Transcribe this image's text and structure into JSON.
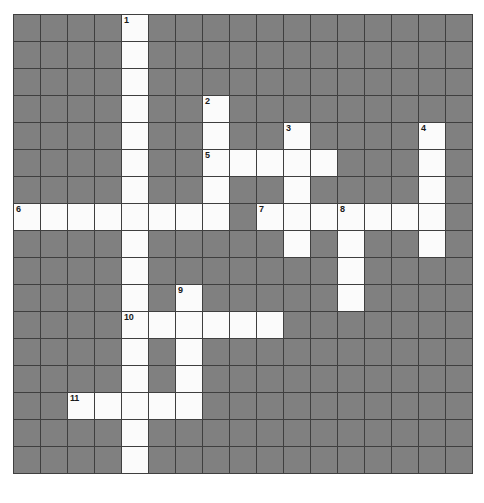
{
  "puzzle": {
    "type": "crossword-grid",
    "title": "Crossword Puzzle Grid",
    "rows": 17,
    "columns": 17,
    "cell_size_px": 26,
    "colors": {
      "block": "#808080",
      "open": "#fbfbfb",
      "gridline": "#3f3f3f",
      "number": "#1a1a1a",
      "page_background": "#ffffff"
    },
    "clue_numbers": [
      {
        "number": "1",
        "row": 0,
        "col": 4,
        "direction": "down"
      },
      {
        "number": "2",
        "row": 3,
        "col": 7,
        "direction": "down"
      },
      {
        "number": "3",
        "row": 4,
        "col": 10,
        "direction": "down"
      },
      {
        "number": "4",
        "row": 4,
        "col": 15,
        "direction": "down"
      },
      {
        "number": "5",
        "row": 5,
        "col": 7,
        "direction": "across"
      },
      {
        "number": "6",
        "row": 7,
        "col": 0,
        "direction": "across"
      },
      {
        "number": "7",
        "row": 7,
        "col": 9,
        "direction": "across"
      },
      {
        "number": "8",
        "row": 7,
        "col": 12,
        "direction": "across"
      },
      {
        "number": "9",
        "row": 10,
        "col": 6,
        "direction": "down"
      },
      {
        "number": "10",
        "row": 11,
        "col": 4,
        "direction": "across"
      },
      {
        "number": "11",
        "row": 14,
        "col": 2,
        "direction": "across"
      }
    ],
    "grid": [
      [
        0,
        0,
        0,
        0,
        1,
        0,
        0,
        0,
        0,
        0,
        0,
        0,
        0,
        0,
        0,
        0,
        0
      ],
      [
        0,
        0,
        0,
        0,
        1,
        0,
        0,
        0,
        0,
        0,
        0,
        0,
        0,
        0,
        0,
        0,
        0
      ],
      [
        0,
        0,
        0,
        0,
        1,
        0,
        0,
        0,
        0,
        0,
        0,
        0,
        0,
        0,
        0,
        0,
        0
      ],
      [
        0,
        0,
        0,
        0,
        1,
        0,
        0,
        1,
        0,
        0,
        0,
        0,
        0,
        0,
        0,
        0,
        0
      ],
      [
        0,
        0,
        0,
        0,
        1,
        0,
        0,
        1,
        0,
        0,
        1,
        0,
        0,
        0,
        0,
        1,
        0
      ],
      [
        0,
        0,
        0,
        0,
        1,
        0,
        0,
        1,
        1,
        1,
        1,
        1,
        0,
        0,
        0,
        1,
        0
      ],
      [
        0,
        0,
        0,
        0,
        1,
        0,
        0,
        1,
        0,
        0,
        1,
        0,
        0,
        0,
        0,
        1,
        0
      ],
      [
        1,
        1,
        1,
        1,
        1,
        1,
        1,
        1,
        0,
        1,
        1,
        1,
        1,
        1,
        1,
        1,
        0
      ],
      [
        0,
        0,
        0,
        0,
        1,
        0,
        0,
        0,
        0,
        0,
        1,
        0,
        1,
        0,
        0,
        1,
        0
      ],
      [
        0,
        0,
        0,
        0,
        1,
        0,
        0,
        0,
        0,
        0,
        0,
        0,
        1,
        0,
        0,
        0,
        0
      ],
      [
        0,
        0,
        0,
        0,
        1,
        0,
        1,
        0,
        0,
        0,
        0,
        0,
        1,
        0,
        0,
        0,
        0
      ],
      [
        0,
        0,
        0,
        0,
        1,
        1,
        1,
        1,
        1,
        1,
        0,
        0,
        0,
        0,
        0,
        0,
        0
      ],
      [
        0,
        0,
        0,
        0,
        1,
        0,
        1,
        0,
        0,
        0,
        0,
        0,
        0,
        0,
        0,
        0,
        0
      ],
      [
        0,
        0,
        0,
        0,
        1,
        0,
        1,
        0,
        0,
        0,
        0,
        0,
        0,
        0,
        0,
        0,
        0
      ],
      [
        0,
        0,
        1,
        1,
        1,
        1,
        1,
        0,
        0,
        0,
        0,
        0,
        0,
        0,
        0,
        0,
        0
      ],
      [
        0,
        0,
        0,
        0,
        1,
        0,
        0,
        0,
        0,
        0,
        0,
        0,
        0,
        0,
        0,
        0,
        0
      ],
      [
        0,
        0,
        0,
        0,
        1,
        0,
        0,
        0,
        0,
        0,
        0,
        0,
        0,
        0,
        0,
        0,
        0
      ]
    ],
    "letters": []
  }
}
